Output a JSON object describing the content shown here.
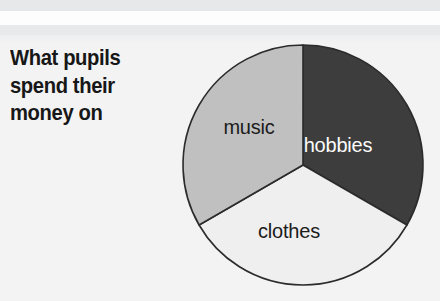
{
  "title": {
    "text": "What pupils\nspend their\nmoney on"
  },
  "colors": {
    "background": "#f4f4f4",
    "band_grey": "#e7e8ea",
    "band_white": "#fdfdfd",
    "outline": "#2b2b2b",
    "title_text": "#171717"
  },
  "chart_data": {
    "type": "pie",
    "title": "What pupils spend their money on",
    "xlabel": "",
    "ylabel": "",
    "grid": false,
    "legend": "none",
    "labels_position": "inside-slice",
    "start_angle_deg": 0,
    "direction": "clockwise",
    "categories": [
      "hobbies",
      "clothes",
      "music"
    ],
    "values": [
      33.3,
      33.3,
      33.3
    ],
    "slices": [
      {
        "label": "hobbies",
        "value": 33.3,
        "start_deg": 0,
        "end_deg": 120,
        "color": "#3d3d3d",
        "label_color": "#fbfbfb",
        "label_x": 338,
        "label_y": 152
      },
      {
        "label": "clothes",
        "value": 33.3,
        "start_deg": 120,
        "end_deg": 240,
        "color": "#efefef",
        "label_color": "#1c1c1c",
        "label_x": 289,
        "label_y": 238
      },
      {
        "label": "music",
        "value": 33.3,
        "start_deg": 240,
        "end_deg": 360,
        "color": "#c0c0c0",
        "label_color": "#1c1c1c",
        "label_x": 249,
        "label_y": 134
      }
    ],
    "geometry": {
      "center_x": 303,
      "center_y": 165,
      "radius": 120
    }
  }
}
